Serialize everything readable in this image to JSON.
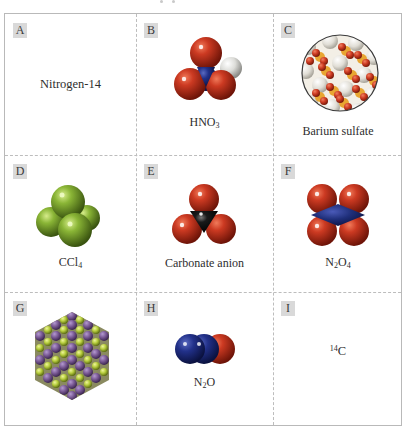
{
  "figure": {
    "cells": [
      {
        "id": "A",
        "label": "A",
        "caption": "Nitrogen-14",
        "type": "text"
      },
      {
        "id": "B",
        "label": "B",
        "caption_main": "HNO",
        "caption_sub": "3",
        "type": "molecule",
        "molecule": "nitric-acid"
      },
      {
        "id": "C",
        "label": "C",
        "caption": "Barium sulfate",
        "type": "lattice-circle",
        "molecule": "barium-sulfate"
      },
      {
        "id": "D",
        "label": "D",
        "caption_main": "CCl",
        "caption_sub": "4",
        "type": "molecule",
        "molecule": "carbon-tetrachloride"
      },
      {
        "id": "E",
        "label": "E",
        "caption": "Carbonate anion",
        "type": "molecule",
        "molecule": "carbonate"
      },
      {
        "id": "F",
        "label": "F",
        "caption_a": "N",
        "caption_sub_a": "2",
        "caption_b": "O",
        "caption_sub_b": "4",
        "type": "molecule",
        "molecule": "dinitrogen-tetroxide"
      },
      {
        "id": "G",
        "label": "G",
        "caption": "",
        "type": "crystal",
        "molecule": "ionic-crystal-lattice"
      },
      {
        "id": "H",
        "label": "H",
        "caption_a": "N",
        "caption_sub_a": "2",
        "caption_b": "O",
        "type": "molecule",
        "molecule": "nitrous-oxide"
      },
      {
        "id": "I",
        "label": "I",
        "caption_sup": "14",
        "caption_main": "C",
        "type": "text"
      }
    ]
  },
  "colors": {
    "oxygen": "#c8321e",
    "nitrogen": "#1f2f7a",
    "hydrogen": "#e6e6e2",
    "carbon": "#141414",
    "chlorine": "#7fa52e",
    "barium": "#e3e1da",
    "sulfur": "#e8a632",
    "lattice_purple": "#7a5a95",
    "lattice_green": "#b5cc3c",
    "badge_bg": "#d9d9d9",
    "grid_line": "#bdbdbd"
  }
}
